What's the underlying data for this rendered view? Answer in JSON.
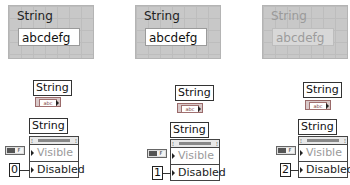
{
  "front_panels": [
    {
      "label": "String",
      "value": "abcdefg",
      "state": "enabled"
    },
    {
      "label": "String",
      "value": "abcdefg",
      "state": "disabled"
    },
    {
      "label": "String",
      "value": "abcdefg",
      "state": "disabled-and-grayed"
    }
  ],
  "block_diagrams": [
    {
      "terminal_label": "String",
      "terminal_type": "abc",
      "property_node": {
        "label": "String",
        "properties": [
          "Visible",
          "Disabled"
        ]
      },
      "visible_constant": "TF",
      "disabled_constant": "0"
    },
    {
      "terminal_label": "String",
      "terminal_type": "abc",
      "property_node": {
        "label": "String",
        "properties": [
          "Visible",
          "Disabled"
        ]
      },
      "visible_constant": "TF",
      "disabled_constant": "1"
    },
    {
      "terminal_label": "String",
      "terminal_type": "abc",
      "property_node": {
        "label": "String",
        "properties": [
          "Visible",
          "Disabled"
        ]
      },
      "visible_constant": "TF",
      "disabled_constant": "2"
    }
  ]
}
